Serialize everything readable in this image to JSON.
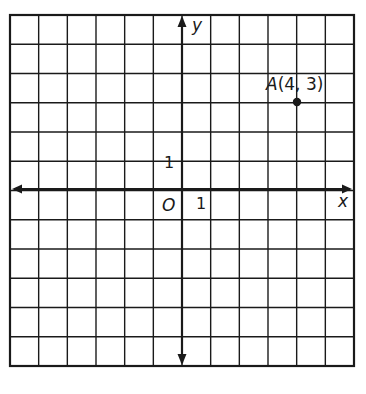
{
  "diagram": {
    "type": "coordinate-plane",
    "grid": {
      "columns": 12,
      "rows": 12,
      "x_min": -6,
      "x_max": 6,
      "y_min": -6,
      "y_max": 6
    },
    "axes": {
      "x_label": "x",
      "y_label": "y",
      "origin_label": "O",
      "x_tick_label": "1",
      "y_tick_label": "1"
    },
    "points": [
      {
        "name": "A",
        "x": 4,
        "y": 3,
        "label": "A(4, 3)"
      }
    ],
    "colors": {
      "line": "#1a1a1a",
      "background": "#ffffff"
    }
  }
}
